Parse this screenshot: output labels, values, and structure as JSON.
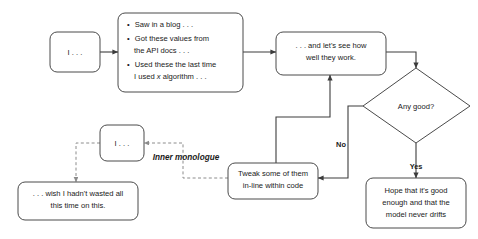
{
  "diagram": {
    "nodes": {
      "start_prompt": {
        "label": "I . . ."
      },
      "sources": {
        "bullets": [
          "Saw in a blog . . .",
          "Got these values from",
          "the API docs . . .",
          "Used these the last time",
          "I used x algorithm . . ."
        ],
        "bullet_markers": [
          true,
          true,
          false,
          true,
          false
        ],
        "italic_word": "x"
      },
      "evaluate": {
        "lines": [
          ". . . and let's see how",
          "well they work."
        ]
      },
      "decision": {
        "label": "Any good?"
      },
      "tweak": {
        "lines": [
          "Tweak some of them",
          "in-line within code"
        ]
      },
      "hope": {
        "lines": [
          "Hope that it's good",
          "enough and that the",
          "model never drifts"
        ]
      },
      "inner_prompt": {
        "label": "I . . ."
      },
      "regret": {
        "lines": [
          ". . . wish I hadn't wasted all",
          "this time on this."
        ]
      }
    },
    "branch_labels": {
      "no": "No",
      "yes": "Yes"
    },
    "annotations": {
      "inner_monologue": "Inner monologue"
    },
    "colors": {
      "background": "#ffffff",
      "node_stroke": "#4a4a4a",
      "edge_solid": "#3c3c3c",
      "edge_dashed": "#8c8c8c",
      "text": "#1a1a1a"
    }
  }
}
